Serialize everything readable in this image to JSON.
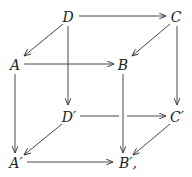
{
  "diagram": {
    "type": "commutative-cube",
    "nodes": [
      {
        "id": "D",
        "label": "D",
        "x": 68,
        "y": 17
      },
      {
        "id": "C",
        "label": "C",
        "x": 176,
        "y": 17
      },
      {
        "id": "A",
        "label": "A",
        "x": 15,
        "y": 65
      },
      {
        "id": "B",
        "label": "B",
        "x": 123,
        "y": 65
      },
      {
        "id": "Dp",
        "label": "D′",
        "x": 69,
        "y": 117
      },
      {
        "id": "Cp",
        "label": "C′",
        "x": 177,
        "y": 117
      },
      {
        "id": "Ap",
        "label": "A′",
        "x": 16,
        "y": 163
      },
      {
        "id": "Bp",
        "label": "B′,",
        "x": 126,
        "y": 163
      }
    ],
    "edges": [
      {
        "from": "D",
        "to": "C"
      },
      {
        "from": "D",
        "to": "A"
      },
      {
        "from": "C",
        "to": "B"
      },
      {
        "from": "A",
        "to": "B"
      },
      {
        "from": "D",
        "to": "Dp"
      },
      {
        "from": "C",
        "to": "Cp"
      },
      {
        "from": "A",
        "to": "Ap"
      },
      {
        "from": "B",
        "to": "Bp"
      },
      {
        "from": "Dp",
        "to": "Cp"
      },
      {
        "from": "Dp",
        "to": "Ap"
      },
      {
        "from": "Cp",
        "to": "Bp"
      },
      {
        "from": "Ap",
        "to": "Bp"
      }
    ]
  }
}
